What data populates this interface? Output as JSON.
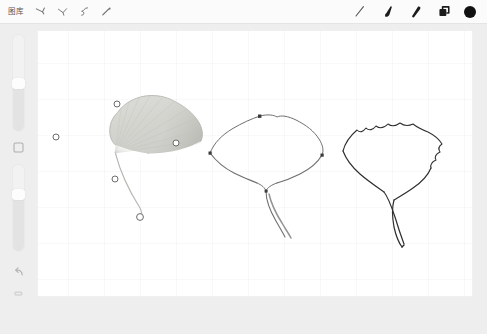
{
  "app": {
    "title": "Drawing App Canvas",
    "canvas_background": "#ffffff",
    "ui_background": "#eeeeee",
    "toolbar_background": "#fbfbfb",
    "accent_color": "#111111"
  },
  "toolbar": {
    "gallery_label": "图库",
    "left_tools": [
      {
        "name": "pen-nib-tool",
        "label": "Pen nib"
      },
      {
        "name": "pencil-stroke-tool",
        "label": "Pencil stroke"
      },
      {
        "name": "curve-path-tool",
        "label": "Curve path"
      },
      {
        "name": "brush-stroke-tool",
        "label": "Brush stroke"
      }
    ],
    "right_tools": [
      {
        "name": "line-tool",
        "label": "Line"
      },
      {
        "name": "brush-tool",
        "label": "Brush"
      },
      {
        "name": "eraser-tool",
        "label": "Eraser"
      },
      {
        "name": "layers-tool",
        "label": "Layers"
      },
      {
        "name": "color-swatch",
        "label": "Color",
        "color": "#111111"
      }
    ]
  },
  "sidebar": {
    "brush_size_slider": {
      "name": "brush-size-slider",
      "label": "Brush size",
      "value": 58
    },
    "opacity_slider": {
      "name": "brush-opacity-slider",
      "label": "Opacity",
      "value": 74
    },
    "buttons": [
      {
        "name": "shape-button",
        "label": "Shape"
      },
      {
        "name": "undo-button",
        "label": "Undo"
      },
      {
        "name": "redo-button",
        "label": "Redo"
      }
    ]
  },
  "canvas": {
    "grid_visible": true,
    "grid_spacing_px": 36,
    "artworks": [
      {
        "name": "leaf-shaded-selected",
        "label": "Ginkgo leaf — shaded, path selected",
        "selected": true,
        "fill": "#d7d7d3",
        "stroke": "#8a8a86",
        "anchor_points": [
          {
            "x": 117,
            "y": 111
          },
          {
            "x": 56,
            "y": 144
          },
          {
            "x": 176,
            "y": 150
          },
          {
            "x": 115,
            "y": 186
          },
          {
            "x": 140,
            "y": 224
          }
        ]
      },
      {
        "name": "leaf-outline-anchors",
        "label": "Ginkgo leaf — outline with anchors",
        "selected": false,
        "fill": "none",
        "stroke": "#6f6f6f",
        "anchor_points": [
          {
            "x": 260,
            "y": 113
          },
          {
            "x": 207,
            "y": 152
          },
          {
            "x": 314,
            "y": 155
          },
          {
            "x": 261,
            "y": 190
          }
        ]
      },
      {
        "name": "leaf-outline-clean",
        "label": "Ginkgo leaf — clean outline",
        "selected": false,
        "fill": "none",
        "stroke": "#2f2f2f",
        "anchor_points": []
      }
    ]
  }
}
